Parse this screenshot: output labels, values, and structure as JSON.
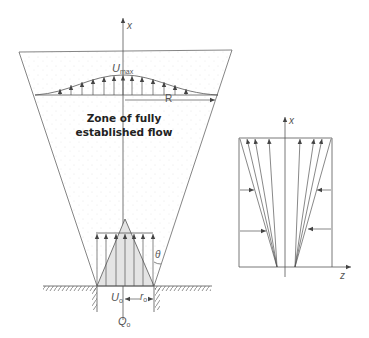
{
  "figure": {
    "main_diagram": {
      "axis_label": "x",
      "profile_label": "U",
      "profile_label_sub": "max",
      "radius_label": "R",
      "zone_text_line1": "Zone of fully",
      "zone_text_line2": "established flow",
      "angle_label": "θ",
      "nozzle_velocity_label": "U",
      "nozzle_velocity_sub": "o",
      "nozzle_radius_label": "r",
      "nozzle_radius_sub": "o",
      "discharge_label": "Q",
      "discharge_sub": "o"
    },
    "side_diagram": {
      "vertical_axis_label": "x",
      "horizontal_axis_label": "z"
    },
    "colors": {
      "line": "#555555",
      "text": "#333333",
      "core_fill": "#e6e6e6",
      "stipple": "#d8d8d8"
    }
  }
}
